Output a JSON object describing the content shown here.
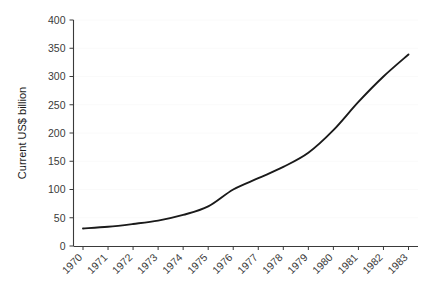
{
  "chart_data": {
    "type": "line",
    "title": "",
    "xlabel": "",
    "ylabel": "Current US$ billion",
    "x": [
      1970,
      1971,
      1972,
      1973,
      1974,
      1975,
      1976,
      1977,
      1978,
      1979,
      1980,
      1981,
      1982,
      1983
    ],
    "categories": [
      "1970",
      "1971",
      "1972",
      "1973",
      "1974",
      "1975",
      "1976",
      "1977",
      "1978",
      "1979",
      "1980",
      "1981",
      "1982",
      "1983"
    ],
    "values": [
      31,
      34,
      39,
      45,
      55,
      70,
      100,
      120,
      140,
      165,
      205,
      255,
      300,
      339
    ],
    "series": [
      {
        "name": "Current US$ billion",
        "values": [
          31,
          34,
          39,
          45,
          55,
          70,
          100,
          120,
          140,
          165,
          205,
          255,
          300,
          339
        ]
      }
    ],
    "ylim": [
      0,
      400
    ],
    "yticks": [
      0,
      50,
      100,
      150,
      200,
      250,
      300,
      350,
      400
    ],
    "ytick_labels": [
      "0",
      "50",
      "100",
      "150",
      "200",
      "250",
      "300",
      "350",
      "400"
    ],
    "xtick_labels": [
      "1970",
      "1971",
      "1972",
      "1973",
      "1974",
      "1975",
      "1976",
      "1977",
      "1978",
      "1979",
      "1980",
      "1981",
      "1982",
      "1983"
    ],
    "grid": "faint-horizontal",
    "legend": "none",
    "line_color": "#1a1a1a",
    "axis_color": "#3a3a3a",
    "background_color": "#ffffff",
    "xtick_label_rotation": "45"
  }
}
